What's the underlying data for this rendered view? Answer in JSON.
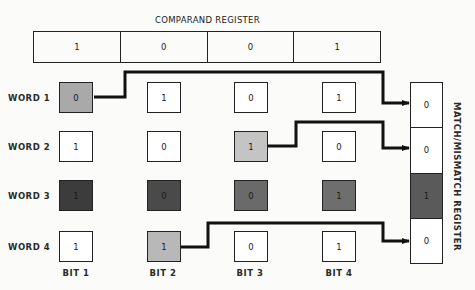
{
  "comparand": {
    "title": "COMPARAND REGISTER",
    "bits": [
      "1",
      "0",
      "0",
      "1"
    ]
  },
  "words": [
    {
      "label": "WORD 1",
      "bits": [
        "0",
        "1",
        "0",
        "1"
      ],
      "shades": [
        "#a9a9a9",
        "#ffffff",
        "#ffffff",
        "#ffffff"
      ]
    },
    {
      "label": "WORD 2",
      "bits": [
        "1",
        "0",
        "1",
        "0"
      ],
      "shades": [
        "#ffffff",
        "#ffffff",
        "#c4c4c4",
        "#ffffff"
      ]
    },
    {
      "label": "WORD 3",
      "bits": [
        "1",
        "0",
        "0",
        "1"
      ],
      "shades": [
        "#3c3c3c",
        "#4a4a4a",
        "#6a6a6a",
        "#6e6e6e"
      ]
    },
    {
      "label": "WORD 4",
      "bits": [
        "1",
        "1",
        "0",
        "1"
      ],
      "shades": [
        "#ffffff",
        "#b8b8b8",
        "#ffffff",
        "#ffffff"
      ]
    }
  ],
  "columns": [
    "BIT 1",
    "BIT 2",
    "BIT 3",
    "BIT 4"
  ],
  "match_register": {
    "title": "MATCH/MISMATCH REGISTER",
    "bits": [
      "0",
      "0",
      "1",
      "0"
    ],
    "shades": [
      "#ffffff",
      "#ffffff",
      "#5a5a5a",
      "#ffffff"
    ]
  }
}
